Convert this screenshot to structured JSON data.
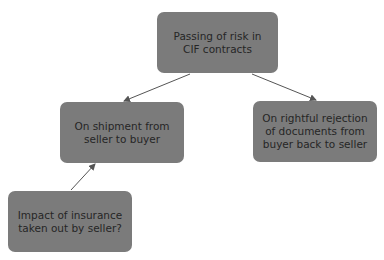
{
  "diagram": {
    "nodes": [
      {
        "id": "root",
        "lines": [
          "Passing of risk in",
          "CIF contracts"
        ]
      },
      {
        "id": "shipment",
        "lines": [
          "On shipment from",
          "seller to buyer"
        ]
      },
      {
        "id": "rejection",
        "lines": [
          "On rightful rejection",
          "of documents from",
          "buyer back to seller"
        ]
      },
      {
        "id": "insurance",
        "lines": [
          "Impact of insurance",
          "taken out by seller?"
        ]
      }
    ],
    "edges": [
      {
        "from": "root",
        "to": "shipment"
      },
      {
        "from": "root",
        "to": "rejection"
      },
      {
        "from": "insurance",
        "to": "shipment"
      }
    ],
    "colors": {
      "node_fill": "#7b7b7b",
      "text": "#262626",
      "edge": "#555555"
    }
  }
}
